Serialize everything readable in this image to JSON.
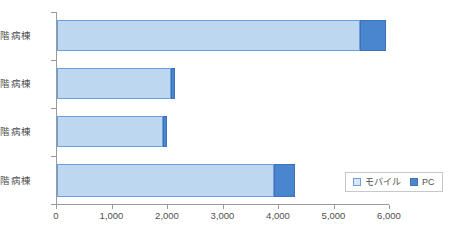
{
  "chart_data": {
    "type": "bar",
    "orientation": "horizontal",
    "stacked": true,
    "title": "",
    "xlabel": "",
    "ylabel": "",
    "categories": [
      "2 階病棟",
      "3 階病棟",
      "4 階病棟",
      "5 階病棟"
    ],
    "series": [
      {
        "name": "モバイル",
        "color": "#bdd7f0",
        "values": [
          5460,
          2050,
          1910,
          3910
        ]
      },
      {
        "name": "PC",
        "color": "#4a86d0",
        "values": [
          465,
          70,
          70,
          380
        ]
      }
    ],
    "totals": [
      5925,
      2120,
      1980,
      4290
    ],
    "xlim": [
      0,
      6000
    ],
    "x_ticks": [
      0,
      1000,
      2000,
      3000,
      4000,
      5000,
      6000
    ],
    "x_tick_labels": [
      "0",
      "1,000",
      "2,000",
      "3,000",
      "4,000",
      "5,000",
      "6,000"
    ],
    "grid": false,
    "legend_position": "bottom-right"
  },
  "legend": {
    "entries": [
      {
        "label": "モバイル",
        "swatch": "mobile-swatch"
      },
      {
        "label": "PC",
        "swatch": "pc-swatch"
      }
    ]
  },
  "axis": {
    "x_labels": [
      "0",
      "1,000",
      "2,000",
      "3,000",
      "4,000",
      "5,000",
      "6,000"
    ],
    "y_labels": [
      "2 階病棟",
      "3 階病棟",
      "4 階病棟",
      "5 階病棟"
    ]
  }
}
